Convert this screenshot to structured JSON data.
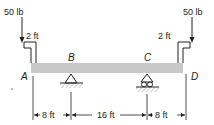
{
  "diagram": {
    "type": "beam-loading",
    "beam": {
      "color": "#c8c8c8",
      "points": [
        "A",
        "B",
        "C",
        "D"
      ]
    },
    "loads": [
      {
        "id": "left-load",
        "label": "50 lb",
        "arm_label": "2 ft",
        "point": "A"
      },
      {
        "id": "right-load",
        "label": "50 lb",
        "arm_label": "2 ft",
        "point": "D"
      }
    ],
    "supports": [
      {
        "point": "B",
        "type": "pin"
      },
      {
        "point": "C",
        "type": "roller"
      }
    ],
    "point_labels": {
      "A": "A",
      "B": "B",
      "C": "C",
      "D": "D"
    },
    "dimensions": [
      {
        "from": "A",
        "to": "B",
        "label": "8 ft"
      },
      {
        "from": "B",
        "to": "C",
        "label": "16 ft"
      },
      {
        "from": "C",
        "to": "D",
        "label": "8 ft"
      }
    ]
  }
}
